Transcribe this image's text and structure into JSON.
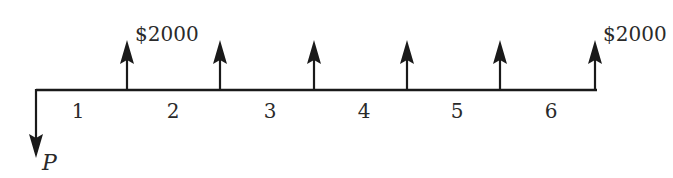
{
  "diagram": {
    "type": "cash-flow-diagram",
    "line_color": "#1a1a1a",
    "text_color": "#2a2a2a",
    "axis": {
      "x_start": 36,
      "x_end": 597,
      "y": 90
    },
    "outflow": {
      "label": "P",
      "x": 36,
      "y_tip": 158
    },
    "inflows": [
      {
        "period": 1,
        "x": 127,
        "label": "$2000"
      },
      {
        "period": 2,
        "x": 220,
        "label": ""
      },
      {
        "period": 3,
        "x": 314,
        "label": ""
      },
      {
        "period": 4,
        "x": 407,
        "label": ""
      },
      {
        "period": 5,
        "x": 500,
        "label": ""
      },
      {
        "period": 6,
        "x": 595,
        "label": "$2000"
      }
    ],
    "period_labels": [
      {
        "text": "1",
        "x": 78
      },
      {
        "text": "2",
        "x": 173
      },
      {
        "text": "3",
        "x": 270
      },
      {
        "text": "4",
        "x": 364
      },
      {
        "text": "5",
        "x": 457
      },
      {
        "text": "6",
        "x": 551
      }
    ],
    "arrow_tip_y": 40
  }
}
